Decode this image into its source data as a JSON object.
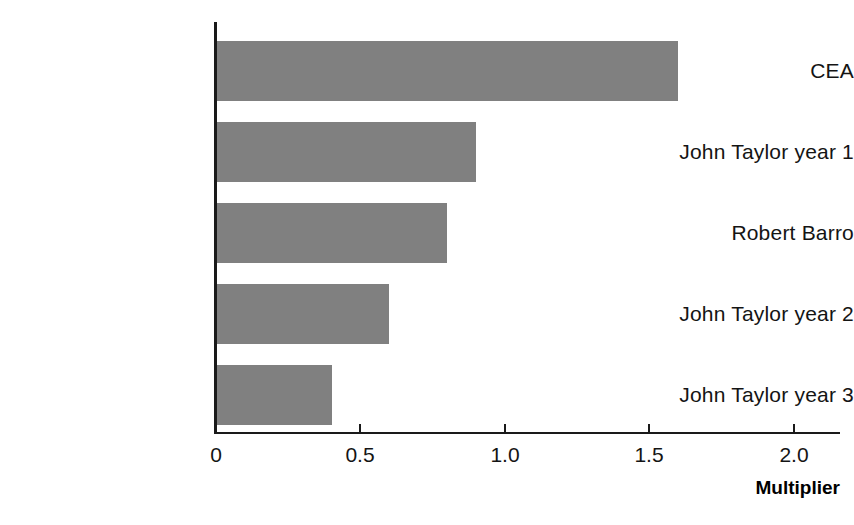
{
  "chart_data": {
    "type": "bar",
    "orientation": "horizontal",
    "title": "",
    "subtitle": "",
    "xlabel": "Multiplier",
    "ylabel": "",
    "categories": [
      "CEA",
      "John Taylor year 1",
      "Robert Barro",
      "John Taylor year 2",
      "John Taylor year 3"
    ],
    "values": [
      1.6,
      0.9,
      0.8,
      0.6,
      0.4
    ],
    "series": [
      {
        "name": "Multiplier",
        "values": [
          1.6,
          0.9,
          0.8,
          0.6,
          0.4
        ]
      }
    ],
    "xlim": [
      0,
      2.1
    ],
    "xticks": [
      0,
      0.5,
      1.0,
      1.5,
      2.0
    ],
    "xtick_labels": [
      "0",
      "0.5",
      "1.0",
      "1.5",
      "2.0"
    ],
    "grid": false,
    "legend": false,
    "legend_position": "none",
    "bar_color": "#808080",
    "axis_color": "#1a1a1a",
    "background_color": "#ffffff",
    "annotations": []
  },
  "axis": {
    "title": "Multiplier",
    "ticks": [
      {
        "label": "0"
      },
      {
        "label": "0.5"
      },
      {
        "label": "1.0"
      },
      {
        "label": "1.5"
      },
      {
        "label": "2.0"
      }
    ]
  },
  "bars": [
    {
      "label": "CEA",
      "value": 1.6
    },
    {
      "label": "John Taylor year 1",
      "value": 0.9
    },
    {
      "label": "Robert Barro",
      "value": 0.8
    },
    {
      "label": "John Taylor year 2",
      "value": 0.6
    },
    {
      "label": "John Taylor year 3",
      "value": 0.4
    }
  ]
}
